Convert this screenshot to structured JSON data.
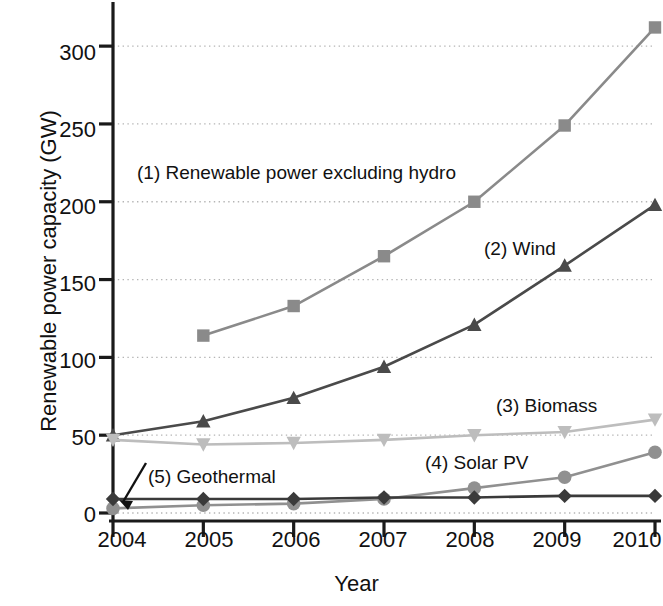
{
  "chart_data": {
    "type": "line",
    "title": "",
    "xlabel": "Year",
    "ylabel": "Renewable power capacity (GW)",
    "x": [
      2004,
      2005,
      2006,
      2007,
      2008,
      2009,
      2010
    ],
    "xtick_labels": [
      "2004",
      "2005",
      "2006",
      "2007",
      "2008",
      "2009",
      "2010"
    ],
    "ytick_labels": [
      "0",
      "50",
      "100",
      "150",
      "200",
      "250",
      "300"
    ],
    "yticks": [
      0,
      50,
      100,
      150,
      200,
      250,
      300
    ],
    "xlim": [
      2004,
      2010
    ],
    "ylim": [
      0,
      320
    ],
    "grid": "horizontal-dotted",
    "legend_position": "inline-annotations",
    "series": [
      {
        "key": "renewable_excl_hydro",
        "name": "(1) Renewable power excluding hydro",
        "marker": "square",
        "color": "#8a8a8a",
        "values": [
          null,
          114,
          133,
          165,
          200,
          249,
          312
        ]
      },
      {
        "key": "wind",
        "name": "(2) Wind",
        "marker": "triangle-up",
        "color": "#4a4a4a",
        "values": [
          50,
          59,
          74,
          94,
          121,
          159,
          198
        ]
      },
      {
        "key": "biomass",
        "name": "(3) Biomass",
        "marker": "triangle-down",
        "color": "#bdbdbd",
        "values": [
          47,
          44,
          45,
          47,
          50,
          52,
          60
        ]
      },
      {
        "key": "solar_pv",
        "name": "(4) Solar PV",
        "marker": "circle",
        "color": "#909090",
        "values": [
          3,
          5,
          6,
          9,
          16,
          23,
          39
        ]
      },
      {
        "key": "geothermal",
        "name": "(5) Geothermal",
        "marker": "diamond",
        "color": "#3a3a3a",
        "values": [
          9,
          9,
          9,
          10,
          10,
          11,
          11
        ]
      }
    ],
    "annotations": [
      {
        "key": "renewable_excl_hydro",
        "text": "(1) Renewable power excluding hydro",
        "x_px": 137,
        "y_px": 162
      },
      {
        "key": "wind",
        "text": "(2) Wind",
        "x_px": 484,
        "y_px": 238
      },
      {
        "key": "biomass",
        "text": "(3) Biomass",
        "x_px": 496,
        "y_px": 395
      },
      {
        "key": "solar_pv",
        "text": "(4) Solar PV",
        "x_px": 425,
        "y_px": 452
      },
      {
        "key": "geothermal",
        "text": "(5) Geothermal",
        "x_px": 148,
        "y_px": 466
      }
    ],
    "axis_color": "#1a1a1a",
    "grid_color": "#b5b5b5",
    "background": "#ffffff"
  }
}
